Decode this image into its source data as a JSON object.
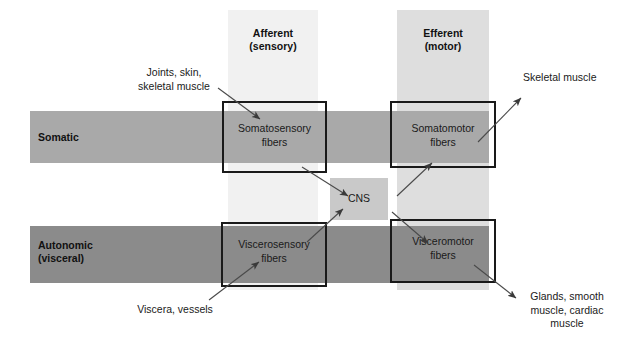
{
  "figure": {
    "width": 621,
    "height": 342,
    "background": "#ffffff"
  },
  "columns": [
    {
      "key": "afferent",
      "label": "Afferent\n(sensory)",
      "color": "#f1f1f1",
      "x": 228,
      "y": 10,
      "w": 90,
      "h": 280,
      "label_x": 228,
      "label_y": 27,
      "label_w": 90
    },
    {
      "key": "efferent",
      "label": "Efferent\n(motor)",
      "color": "#dedede",
      "x": 397,
      "y": 10,
      "w": 92,
      "h": 280,
      "label_x": 397,
      "label_y": 27,
      "label_w": 92
    }
  ],
  "bars": [
    {
      "key": "somatic",
      "label": "Somatic",
      "color": "#a9a9a9",
      "x": 30,
      "y": 111,
      "w": 459,
      "h": 52,
      "label_x": 38,
      "label_y": 131
    },
    {
      "key": "autonomic",
      "label": "Autonomic\n(visceral)",
      "color": "#8b8b8b",
      "x": 30,
      "y": 226,
      "w": 459,
      "h": 57,
      "label_x": 38,
      "label_y": 239
    }
  ],
  "fiber_boxes": [
    {
      "key": "somatosensory",
      "label": "Somatosensory\nfibers",
      "x": 222,
      "y": 101,
      "w": 105,
      "h": 72,
      "label_x": 222,
      "label_y": 122,
      "label_w": 105,
      "border": "#1a1a1a"
    },
    {
      "key": "somatomotor",
      "label": "Somatomotor\nfibers",
      "x": 390,
      "y": 101,
      "w": 106,
      "h": 67,
      "label_x": 390,
      "label_y": 122,
      "label_w": 106,
      "border": "#1a1a1a"
    },
    {
      "key": "viscerosensory",
      "label": "Viscerosensory\nfibers",
      "x": 221,
      "y": 222,
      "w": 106,
      "h": 65,
      "label_x": 221,
      "label_y": 238,
      "label_w": 106,
      "border": "#1a1a1a"
    },
    {
      "key": "visceromotor",
      "label": "Visceromotor\nfibers",
      "x": 390,
      "y": 219,
      "w": 106,
      "h": 64,
      "label_x": 390,
      "label_y": 235,
      "label_w": 106,
      "border": "#1a1a1a"
    }
  ],
  "cns": {
    "label": "CNS",
    "color": "#c9c9c9",
    "x": 330,
    "y": 178,
    "w": 58,
    "h": 42,
    "label_x": 330,
    "label_y": 192,
    "label_w": 58
  },
  "annotations": [
    {
      "key": "joints-skin-skeletal-muscle",
      "text": "Joints, skin,\nskeletal muscle",
      "x": 126,
      "y": 66,
      "w": 96,
      "align": "center"
    },
    {
      "key": "skeletal-muscle",
      "text": "Skeletal muscle",
      "x": 523,
      "y": 71,
      "w": 92,
      "align": "left"
    },
    {
      "key": "viscera-vessels",
      "text": "Viscera, vessels",
      "x": 126,
      "y": 303,
      "w": 98,
      "align": "center"
    },
    {
      "key": "glands-smooth-muscle-cardiac-muscle",
      "text": "Glands, smooth\nmuscle, cardiac\nmuscle",
      "x": 519,
      "y": 290,
      "w": 96,
      "align": "center"
    }
  ],
  "arrows": [
    {
      "key": "arrow-joints-to-somatosensory",
      "x1": 218,
      "y1": 88,
      "x2": 260,
      "y2": 119
    },
    {
      "key": "arrow-somatosensory-to-cns",
      "x1": 302,
      "y1": 167,
      "x2": 348,
      "y2": 196
    },
    {
      "key": "arrow-cns-to-somatomotor",
      "x1": 397,
      "y1": 196,
      "x2": 432,
      "y2": 163
    },
    {
      "key": "arrow-somatomotor-to-skeletal-muscle",
      "x1": 478,
      "y1": 142,
      "x2": 521,
      "y2": 98
    },
    {
      "key": "arrow-viscera-to-viscerosensory",
      "x1": 209,
      "y1": 300,
      "x2": 259,
      "y2": 262
    },
    {
      "key": "arrow-viscerosensory-to-cns",
      "x1": 307,
      "y1": 242,
      "x2": 343,
      "y2": 209
    },
    {
      "key": "arrow-cns-to-visceromotor",
      "x1": 392,
      "y1": 212,
      "x2": 428,
      "y2": 243
    },
    {
      "key": "arrow-visceromotor-to-glands",
      "x1": 474,
      "y1": 265,
      "x2": 516,
      "y2": 298
    }
  ]
}
